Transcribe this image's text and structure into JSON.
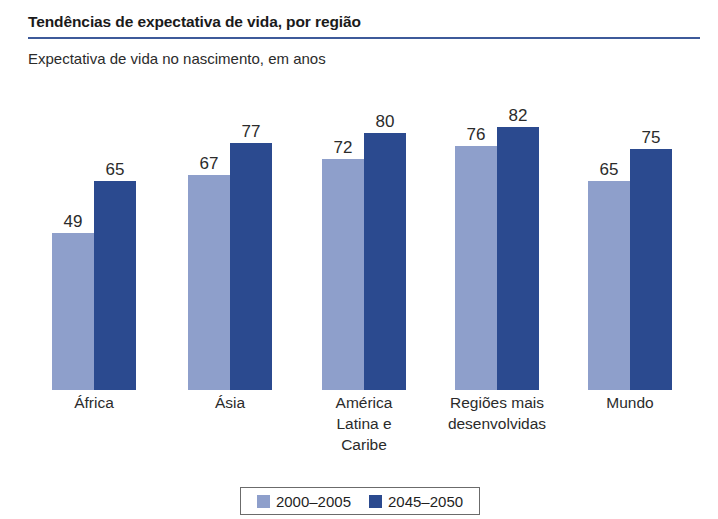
{
  "header": {
    "title": "Tendências de expectativa de vida, por região",
    "subtitle": "Expectativa de vida no nascimento, em anos",
    "rule_color": "#3d5a9a"
  },
  "legend": {
    "items": [
      {
        "label": "2000–2005",
        "color": "#8e9fcb"
      },
      {
        "label": "2045–2050",
        "color": "#2b4a8f"
      }
    ]
  },
  "chart_data": {
    "type": "bar",
    "title": "Tendências de expectativa de vida, por região",
    "subtitle": "Expectativa de vida no nascimento, em anos",
    "xlabel": "",
    "ylabel": "Expectativa de vida no nascimento, em anos",
    "ylim": [
      0,
      90
    ],
    "grid": false,
    "legend_position": "bottom",
    "categories": [
      "África",
      "Ásia",
      "América Latina e Caribe",
      "Regiões mais desenvolvidas",
      "Mundo"
    ],
    "category_lines": [
      [
        "África"
      ],
      [
        "Ásia"
      ],
      [
        "América",
        "Latina e",
        "Caribe"
      ],
      [
        "Regiões mais",
        "desenvolvidas"
      ],
      [
        "Mundo"
      ]
    ],
    "series": [
      {
        "name": "2000–2005",
        "color": "#8e9fcb",
        "values": [
          49,
          67,
          72,
          76,
          65
        ]
      },
      {
        "name": "2045–2050",
        "color": "#2b4a8f",
        "values": [
          65,
          77,
          80,
          82,
          75
        ]
      }
    ]
  },
  "layout": {
    "group_left": [
      52,
      188,
      322,
      455,
      588
    ],
    "bar_width": 42,
    "px_per_unit": 3.21,
    "baseline_y": 390
  }
}
